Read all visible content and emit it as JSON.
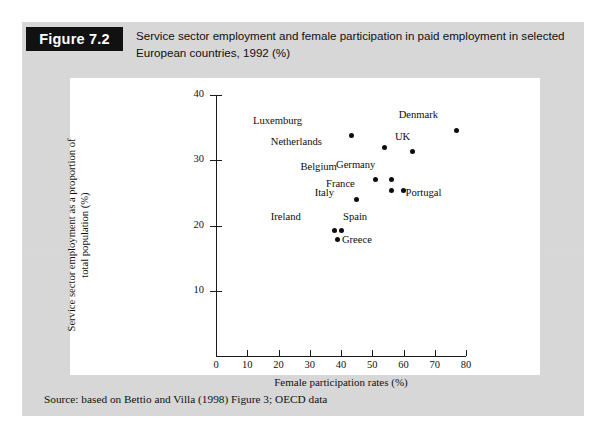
{
  "figure": {
    "tag": "Figure 7.2",
    "caption": "Service sector employment and female participation in paid employment in selected European countries, 1992 (%)",
    "source": "Source: based on Bettio and Villa (1998) Figure 3; OECD data"
  },
  "chart_data": {
    "type": "scatter",
    "title": "",
    "xlabel": "Female participation rates (%)",
    "ylabel": "Service sector employment as a proportion of total population (%)",
    "xlim": [
      0,
      80
    ],
    "ylim": [
      0,
      40
    ],
    "xticks": [
      0,
      10,
      20,
      30,
      40,
      50,
      60,
      70,
      80
    ],
    "yticks": [
      10,
      20,
      30,
      40
    ],
    "grid": false,
    "legend": "none",
    "points": [
      {
        "label": "Luxemburg",
        "x": 43.5,
        "y": 33.8,
        "label_dx": -56,
        "label_dy": -14
      },
      {
        "label": "Netherlands",
        "x": 54.0,
        "y": 31.9,
        "label_dx": -69,
        "label_dy": -6
      },
      {
        "label": "UK",
        "x": 63.0,
        "y": 31.3,
        "label_dx": -9,
        "label_dy": -15
      },
      {
        "label": "Denmark",
        "x": 77.0,
        "y": 34.6,
        "label_dx": -25,
        "label_dy": -15
      },
      {
        "label": "Belgium",
        "x": 51.0,
        "y": 27.0,
        "label_dx": -44,
        "label_dy": -13
      },
      {
        "label": "Germany",
        "x": 56.0,
        "y": 27.1,
        "label_dx": -22,
        "label_dy": -14
      },
      {
        "label": "France",
        "x": 56.0,
        "y": 25.4,
        "label_dx": -42,
        "label_dy": -6
      },
      {
        "label": "Portugal",
        "x": 60.0,
        "y": 25.4,
        "label_dx": 2,
        "label_dy": 3
      },
      {
        "label": "Italy",
        "x": 45.0,
        "y": 24.0,
        "label_dx": -29,
        "label_dy": -6
      },
      {
        "label": "Ireland",
        "x": 38.0,
        "y": 19.2,
        "label_dx": -40,
        "label_dy": -14
      },
      {
        "label": "Spain",
        "x": 40.0,
        "y": 19.2,
        "label_dx": 2,
        "label_dy": -14
      },
      {
        "label": "Greece",
        "x": 39.0,
        "y": 17.8,
        "label_dx": 4,
        "label_dy": 0
      }
    ]
  },
  "colors": {
    "page_background": "#d6d6d6",
    "panel_background": "#ffffff",
    "tag_background": "#111111",
    "ink": "#101010"
  }
}
